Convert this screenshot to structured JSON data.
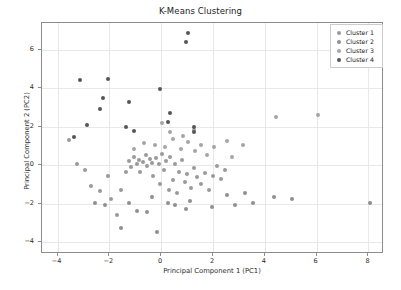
{
  "chart_data": {
    "type": "scatter",
    "title": "K-Means Clustering",
    "xlabel": "Principal Component 1 (PC1)",
    "ylabel": "Principal Component 2 (PC2)",
    "xlim": [
      -4.6,
      8.6
    ],
    "ylim": [
      -4.6,
      7.4
    ],
    "xticks": [
      -4,
      -2,
      0,
      2,
      4,
      6,
      8
    ],
    "xtick_labels": [
      "−4",
      "−2",
      "0",
      "2",
      "4",
      "6",
      "8"
    ],
    "yticks": [
      -4,
      -2,
      0,
      2,
      4,
      6
    ],
    "ytick_labels": [
      "−4",
      "−2",
      "0",
      "2",
      "4",
      "6"
    ],
    "grid": true,
    "legend_position": "upper right",
    "marker": "circle",
    "marker_size": 4,
    "series": [
      {
        "name": "Cluster 1",
        "color": "#9a9a9a",
        "points": [
          [
            -3.55,
            1.3
          ],
          [
            -3.25,
            0.05
          ],
          [
            -2.95,
            -0.25
          ],
          [
            -2.7,
            -1.05
          ],
          [
            -2.35,
            -1.35
          ],
          [
            -2.05,
            -0.55
          ],
          [
            -1.95,
            -1.75
          ],
          [
            -1.7,
            -2.55
          ],
          [
            -1.55,
            -1.25
          ],
          [
            -1.35,
            -0.35
          ],
          [
            -1.25,
            0.25
          ],
          [
            -1.15,
            -0.1
          ],
          [
            -1.05,
            0.45
          ],
          [
            -0.95,
            0.1
          ],
          [
            -0.85,
            0.3
          ],
          [
            -0.8,
            -0.35
          ],
          [
            -0.7,
            0.2
          ],
          [
            -0.6,
            0.55
          ],
          [
            -0.55,
            -0.05
          ],
          [
            -0.45,
            0.35
          ],
          [
            -0.35,
            0.15
          ],
          [
            -0.3,
            -0.55
          ],
          [
            -0.2,
            0.4
          ],
          [
            -0.1,
            0.05
          ],
          [
            -0.05,
            -0.95
          ],
          [
            0.05,
            0.6
          ],
          [
            0.1,
            -0.25
          ],
          [
            0.2,
            0.25
          ],
          [
            0.3,
            -1.25
          ],
          [
            0.35,
            0.45
          ],
          [
            0.45,
            -0.75
          ],
          [
            0.55,
            0.1
          ],
          [
            0.6,
            -1.45
          ],
          [
            0.7,
            -0.35
          ],
          [
            0.8,
            0.3
          ],
          [
            0.9,
            -0.85
          ],
          [
            1.0,
            -0.45
          ],
          [
            1.15,
            -1.15
          ],
          [
            1.25,
            -0.15
          ],
          [
            1.4,
            -0.6
          ],
          [
            1.55,
            -0.95
          ],
          [
            1.7,
            -0.4
          ],
          [
            1.85,
            -1.25
          ],
          [
            2.0,
            -0.55
          ],
          [
            2.15,
            -0.05
          ],
          [
            2.3,
            -0.7
          ],
          [
            2.45,
            -0.25
          ]
        ]
      },
      {
        "name": "Cluster 2",
        "color": "#8f8f8f",
        "points": [
          [
            -1.55,
            -3.25
          ],
          [
            -0.95,
            -2.35
          ],
          [
            -0.55,
            -2.4
          ],
          [
            -0.15,
            -3.45
          ],
          [
            0.25,
            -1.95
          ],
          [
            -1.25,
            -1.95
          ],
          [
            -2.15,
            -2.05
          ],
          [
            -0.35,
            -1.65
          ],
          [
            0.55,
            -2.05
          ],
          [
            1.1,
            -1.85
          ],
          [
            1.95,
            -2.15
          ],
          [
            2.55,
            -1.55
          ],
          [
            3.25,
            -1.45
          ],
          [
            3.55,
            -1.95
          ],
          [
            4.35,
            -1.65
          ],
          [
            5.05,
            -1.75
          ],
          [
            8.05,
            -1.95
          ],
          [
            2.85,
            -2.05
          ],
          [
            -2.55,
            -1.95
          ],
          [
            0.95,
            -2.25
          ]
        ]
      },
      {
        "name": "Cluster 3",
        "color": "#a5a5a5",
        "points": [
          [
            -0.25,
            1.05
          ],
          [
            0.15,
            0.95
          ],
          [
            0.45,
            1.35
          ],
          [
            0.75,
            0.85
          ],
          [
            1.05,
            1.2
          ],
          [
            1.3,
            0.75
          ],
          [
            1.55,
            1.05
          ],
          [
            0.35,
            1.75
          ],
          [
            0.85,
            1.55
          ],
          [
            1.75,
            0.55
          ],
          [
            2.05,
            0.95
          ],
          [
            -0.65,
            1.15
          ],
          [
            -1.05,
            0.85
          ],
          [
            4.45,
            2.5
          ],
          [
            6.05,
            2.6
          ],
          [
            3.15,
            1.05
          ],
          [
            2.75,
            0.45
          ],
          [
            2.55,
            1.25
          ],
          [
            0.05,
            2.2
          ],
          [
            1.25,
            1.85
          ]
        ]
      },
      {
        "name": "Cluster 4",
        "color": "#555555",
        "points": [
          [
            1.05,
            6.9
          ],
          [
            0.95,
            6.4
          ],
          [
            -2.05,
            4.5
          ],
          [
            -3.15,
            4.45
          ],
          [
            -2.25,
            3.5
          ],
          [
            -1.25,
            3.3
          ],
          [
            -0.05,
            3.95
          ],
          [
            0.35,
            2.7
          ],
          [
            -2.85,
            2.1
          ],
          [
            -1.35,
            2.0
          ],
          [
            -1.05,
            1.8
          ],
          [
            1.25,
            2.0
          ],
          [
            1.25,
            1.75
          ],
          [
            0.25,
            2.25
          ],
          [
            -3.35,
            1.5
          ],
          [
            -2.35,
            2.95
          ]
        ]
      }
    ]
  },
  "legend": {
    "items": [
      {
        "label": "Cluster 1"
      },
      {
        "label": "Cluster 2"
      },
      {
        "label": "Cluster 3"
      },
      {
        "label": "Cluster 4"
      }
    ]
  }
}
